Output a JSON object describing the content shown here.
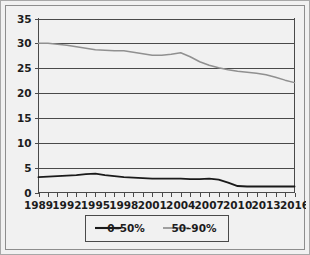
{
  "chart_data": {
    "type": "line",
    "title": "",
    "subtitle": "",
    "xlabel": "",
    "ylabel": "",
    "xlim": [
      1989,
      2016
    ],
    "ylim": [
      0,
      35
    ],
    "ytick_step": 5,
    "yticks": [
      "0",
      "5",
      "10",
      "15",
      "20",
      "25",
      "30",
      "35"
    ],
    "xticks": [
      "1989",
      "1992",
      "1995",
      "1998",
      "2001",
      "2004",
      "2007",
      "2010",
      "2013",
      "2016"
    ],
    "xtick_minor_step": 1,
    "grid": "horizontal",
    "legend_position": "bottom-center",
    "x": [
      1989,
      1990,
      1991,
      1992,
      1993,
      1994,
      1995,
      1996,
      1997,
      1998,
      1999,
      2000,
      2001,
      2002,
      2003,
      2004,
      2005,
      2006,
      2007,
      2008,
      2009,
      2010,
      2011,
      2012,
      2013,
      2014,
      2015,
      2016
    ],
    "series": [
      {
        "name": "0–50%",
        "color": "#1a1a1a",
        "values": [
          3.1,
          3.2,
          3.3,
          3.4,
          3.5,
          3.7,
          3.8,
          3.5,
          3.3,
          3.1,
          3.0,
          2.9,
          2.8,
          2.8,
          2.8,
          2.8,
          2.7,
          2.7,
          2.8,
          2.6,
          2.0,
          1.3,
          1.2,
          1.2,
          1.2,
          1.2,
          1.2,
          1.2
        ]
      },
      {
        "name": "50–90%",
        "color": "#909090",
        "values": [
          30.0,
          30.0,
          29.8,
          29.6,
          29.3,
          29.0,
          28.7,
          28.6,
          28.5,
          28.5,
          28.2,
          27.9,
          27.6,
          27.6,
          27.8,
          28.1,
          27.3,
          26.3,
          25.6,
          25.1,
          24.7,
          24.4,
          24.2,
          24.0,
          23.7,
          23.2,
          22.6,
          22.1
        ]
      }
    ]
  },
  "legend": {
    "items": [
      {
        "label": "0–50%",
        "color": "#1a1a1a"
      },
      {
        "label": "50–90%",
        "color": "#909090"
      }
    ]
  },
  "colors": {
    "background": "#f1f1f1",
    "plot_background": "#f1f1f1",
    "axis": "#4a4a4a",
    "grid": "#4a4a4a",
    "border": "#8d8d8d",
    "text": "#1c1c1c",
    "series_low": "#1a1a1a",
    "series_high": "#909090"
  }
}
